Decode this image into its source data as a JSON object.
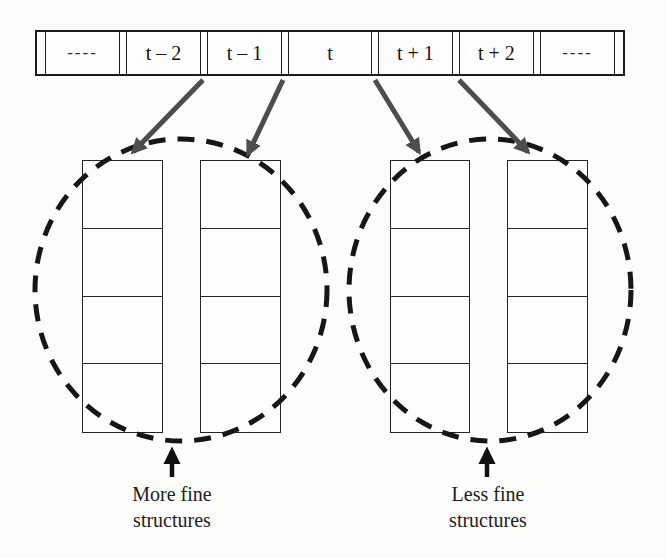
{
  "figure": {
    "background_color": "#fcfcfb",
    "ink_color": "#1c1c1c",
    "arrow_color": "#4d4d4d"
  },
  "timeline": {
    "cells": [
      "----",
      "t – 2",
      "t – 1",
      "t",
      "t + 1",
      "t + 2",
      "----"
    ]
  },
  "groups": {
    "left": {
      "columns": 2,
      "rows_per_column": 4,
      "caption_line1": "More fine",
      "caption_line2": "structures"
    },
    "right": {
      "columns": 2,
      "rows_per_column": 4,
      "caption_line1": "Less fine",
      "caption_line2": "structures"
    }
  }
}
